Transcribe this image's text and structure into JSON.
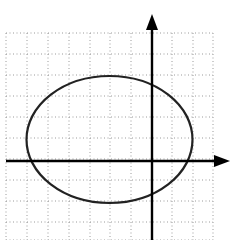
{
  "diagram": {
    "type": "ellipse-on-coordinate-grid",
    "grid": {
      "style": "dotted",
      "color": "#9a9a9a",
      "x_lines": [
        6,
        27,
        48,
        69,
        90,
        110,
        131,
        152,
        172,
        193,
        213
      ],
      "y_lines": [
        33,
        54,
        75,
        96,
        117,
        138,
        159,
        180,
        201,
        222,
        240
      ]
    },
    "axes": {
      "color": "#000000",
      "x_axis": {
        "y": 161,
        "x_start": 6,
        "x_end": 230
      },
      "y_axis": {
        "x": 152,
        "y_start": 240,
        "y_end": 14
      }
    },
    "ellipse": {
      "cx": 109.5,
      "cy": 139.5,
      "rx": 83,
      "ry": 63.5,
      "stroke": "#222222"
    }
  }
}
